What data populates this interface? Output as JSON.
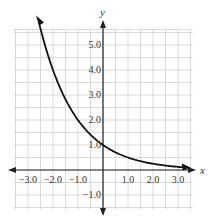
{
  "chart_data": {
    "type": "line",
    "title": "",
    "xlabel": "x",
    "ylabel": "y",
    "function": "y = (1/2)^x",
    "xlim": [
      -3.5,
      3.5
    ],
    "ylim": [
      -1.5,
      5.5
    ],
    "grid": true,
    "grid_step": 0.5,
    "x_ticks": [
      -3.0,
      -2.0,
      -1.0,
      1.0,
      2.0,
      3.0
    ],
    "x_tick_labels": [
      "−3.0",
      "−2.0",
      "−1.0",
      "1.0",
      "2.0",
      "3.0"
    ],
    "y_ticks": [
      5.0,
      4.0,
      3.0,
      2.0,
      1.0,
      -1.0
    ],
    "y_tick_labels": [
      "5.0",
      "4.0",
      "3.0",
      "2.0",
      "1.0",
      "−1.0"
    ],
    "series": [
      {
        "name": "exponential decay",
        "x": [
          -2.5,
          -2.0,
          -1.5,
          -1.0,
          -0.5,
          0.0,
          0.5,
          1.0,
          1.5,
          2.0,
          2.5,
          3.0,
          3.4
        ],
        "y": [
          5.66,
          4.0,
          2.83,
          2.0,
          1.41,
          1.0,
          0.71,
          0.5,
          0.35,
          0.25,
          0.18,
          0.13,
          0.09
        ],
        "color": "#111111",
        "arrows_both_ends": true
      }
    ],
    "legend": null
  },
  "colors": {
    "grid": "#d0d0d0",
    "axis": "#222222",
    "curve": "#111111"
  }
}
